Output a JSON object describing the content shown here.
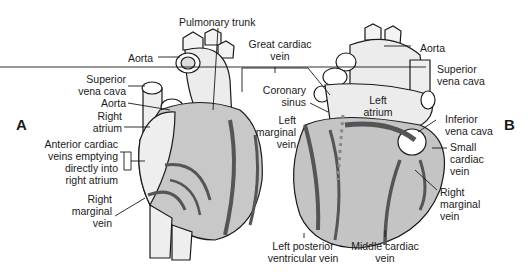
{
  "figure": {
    "panels": [
      {
        "id": "A",
        "label": "A",
        "view": "anterior",
        "labels": [
          {
            "key": "pulmonary_trunk",
            "text": [
              "Pulmonary trunk"
            ]
          },
          {
            "key": "aorta_top",
            "text": [
              "Aorta"
            ]
          },
          {
            "key": "svc",
            "text": [
              "Superior",
              "vena cava"
            ]
          },
          {
            "key": "aorta_low",
            "text": [
              "Aorta"
            ]
          },
          {
            "key": "right_atrium",
            "text": [
              "Right",
              "atrium"
            ]
          },
          {
            "key": "anterior_cardiac",
            "text": [
              "Anterior cardiac",
              "veins emptying",
              "directly into",
              "right atrium"
            ]
          },
          {
            "key": "right_marginal",
            "text": [
              "Right",
              "marginal",
              "vein"
            ]
          }
        ]
      },
      {
        "id": "B",
        "label": "B",
        "view": "posterior",
        "labels": [
          {
            "key": "aorta",
            "text": [
              "Aorta"
            ]
          },
          {
            "key": "svc",
            "text": [
              "Superior",
              "vena cava"
            ]
          },
          {
            "key": "left_atrium",
            "text": [
              "Left",
              "atrium"
            ]
          },
          {
            "key": "ivc",
            "text": [
              "Inferior",
              "vena cava"
            ]
          },
          {
            "key": "small_cardiac",
            "text": [
              "Small",
              "cardiac",
              "vein"
            ]
          },
          {
            "key": "right_marginal",
            "text": [
              "Right",
              "marginal",
              "vein"
            ]
          },
          {
            "key": "middle_cardiac",
            "text": [
              "Middle cardiac",
              "vein"
            ]
          },
          {
            "key": "left_posterior",
            "text": [
              "Left posterior",
              "ventricular vein"
            ]
          },
          {
            "key": "coronary_sinus",
            "text": [
              "Coronary",
              "sinus"
            ]
          },
          {
            "key": "left_marginal",
            "text": [
              "Left",
              "marginal",
              "vein"
            ]
          }
        ]
      }
    ],
    "shared_labels": [
      {
        "key": "great_cardiac",
        "text": [
          "Great cardiac",
          "vein"
        ]
      }
    ]
  },
  "colors": {
    "vein": "#555555",
    "myocardium": "#bdbdbd",
    "outline": "#1a1a1a",
    "background": "#ffffff"
  }
}
